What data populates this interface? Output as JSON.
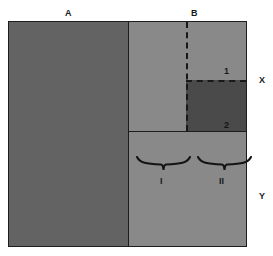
{
  "figure": {
    "type": "schematic-diagram",
    "background_color": "#ffffff",
    "frame_border_color": "#1d1d1d"
  },
  "labels": {
    "top_left": "A",
    "top_right": "B",
    "right_upper": "X",
    "right_lower": "Y",
    "subregion_one": "1",
    "subregion_two": "2",
    "brace_left": "I",
    "brace_right": "II"
  },
  "regions": [
    {
      "id": "region-a",
      "label": "A",
      "fill": "#636363",
      "description": "large left panel"
    },
    {
      "id": "region-b",
      "label": "B",
      "fill": "#898989",
      "description": "right panel, lighter"
    },
    {
      "id": "region-one",
      "label": "1",
      "fill": "#898989",
      "description": "upper right sub-block within B"
    },
    {
      "id": "region-two",
      "label": "2",
      "fill": "#4a4a4a",
      "description": "lower right dark sub-block within B"
    }
  ],
  "bands": [
    {
      "id": "band-x",
      "label": "X",
      "description": "upper band of right panel"
    },
    {
      "id": "band-y",
      "label": "Y",
      "description": "lower band of right panel"
    }
  ],
  "braces": [
    {
      "id": "brace-i",
      "label": "I"
    },
    {
      "id": "brace-ii",
      "label": "II"
    }
  ],
  "colors": {
    "region_a": "#636363",
    "region_b": "#898989",
    "region_two": "#4a4a4a",
    "stroke": "#1d1d1d",
    "dashed": "#181818",
    "text": "#1a1a1a",
    "background": "#ffffff"
  }
}
